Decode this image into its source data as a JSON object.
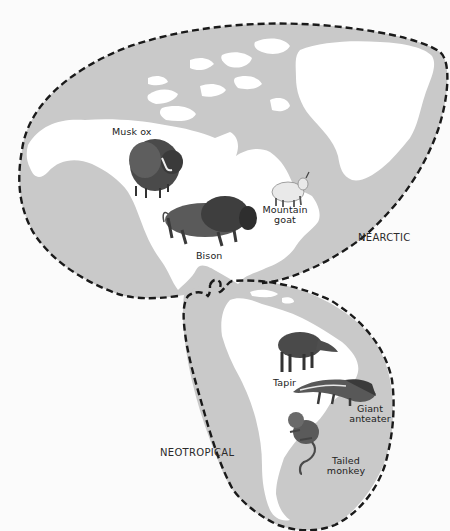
{
  "map": {
    "colors": {
      "background": "#fbfbfb",
      "region_fill": "#c9c9c9",
      "land": "#ffffff",
      "boundary": "#1a1a1a",
      "animal_dark": "#3a3a3a",
      "animal_mid": "#6a6a6a",
      "animal_light": "#e8e8e8"
    },
    "regions": [
      {
        "name": "NEARCTIC",
        "label": "NEARCTIC"
      },
      {
        "name": "NEOTROPICAL",
        "label": "NEOTROPICAL"
      }
    ],
    "animals": {
      "musk_ox": {
        "label": "Musk ox"
      },
      "bison": {
        "label": "Bison"
      },
      "mountain_goat": {
        "label_line1": "Mountain",
        "label_line2": "goat"
      },
      "tapir": {
        "label": "Tapir"
      },
      "giant_anteater": {
        "label_line1": "Giant",
        "label_line2": "anteater"
      },
      "tailed_monkey": {
        "label_line1": "Tailed",
        "label_line2": "monkey"
      }
    }
  }
}
